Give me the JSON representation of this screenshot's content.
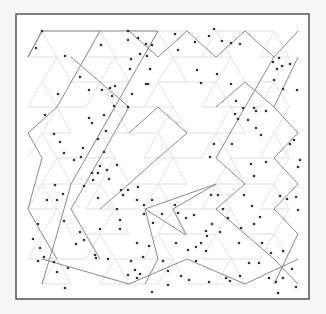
{
  "diagram": {
    "frame": {
      "x": 16,
      "y": 14,
      "w": 293,
      "h": 285,
      "stroke": "#555555",
      "fill": "#ffffff"
    },
    "lattice": {
      "rows_y": [
        31,
        57,
        82,
        107,
        133,
        158,
        184,
        209,
        234,
        259,
        284
      ],
      "even_x0": 42,
      "odd_x0": 28,
      "dx": 29,
      "faint_color": "#d8d8d8",
      "path_color": "#8a8a8a",
      "dot_color": "#333333"
    },
    "paths": [
      [
        [
          42,
          31
        ],
        [
          28,
          57
        ],
        [
          42,
          31
        ],
        [
          158,
          31
        ]
      ],
      [
        [
          158,
          31
        ],
        [
          100,
          133
        ],
        [
          71,
          184
        ],
        [
          57,
          234
        ],
        [
          42,
          284
        ]
      ],
      [
        [
          100,
          31
        ],
        [
          57,
          107
        ],
        [
          28,
          133
        ],
        [
          42,
          158
        ],
        [
          28,
          209
        ],
        [
          42,
          234
        ],
        [
          57,
          259
        ]
      ],
      [
        [
          71,
          57
        ],
        [
          100,
          82
        ],
        [
          129,
          107
        ],
        [
          100,
          158
        ],
        [
          71,
          209
        ],
        [
          100,
          259
        ]
      ],
      [
        [
          187,
          31
        ],
        [
          216,
          57
        ],
        [
          245,
          31
        ],
        [
          274,
          57
        ],
        [
          298,
          31
        ]
      ],
      [
        [
          187,
          31
        ],
        [
          158,
          57
        ],
        [
          129,
          31
        ]
      ],
      [
        [
          274,
          57
        ],
        [
          245,
          107
        ],
        [
          216,
          158
        ],
        [
          245,
          184
        ],
        [
          216,
          209
        ],
        [
          245,
          234
        ],
        [
          274,
          259
        ],
        [
          298,
          284
        ]
      ],
      [
        [
          145,
          209
        ],
        [
          216,
          184
        ],
        [
          173,
          209
        ],
        [
          186,
          235
        ],
        [
          145,
          209
        ],
        [
          158,
          259
        ],
        [
          145,
          284
        ]
      ],
      [
        [
          298,
          57
        ],
        [
          274,
          107
        ],
        [
          298,
          133
        ],
        [
          274,
          158
        ],
        [
          298,
          184
        ],
        [
          274,
          209
        ],
        [
          298,
          234
        ],
        [
          274,
          284
        ]
      ],
      [
        [
          129,
          133
        ],
        [
          158,
          107
        ],
        [
          187,
          133
        ],
        [
          158,
          158
        ],
        [
          129,
          184
        ],
        [
          100,
          209
        ]
      ],
      [
        [
          42,
          259
        ],
        [
          129,
          284
        ],
        [
          187,
          259
        ],
        [
          245,
          284
        ],
        [
          298,
          259
        ]
      ],
      [
        [
          216,
          107
        ],
        [
          245,
          82
        ],
        [
          274,
          107
        ]
      ]
    ],
    "dots": [
      [
        42,
        31
      ],
      [
        36,
        48
      ],
      [
        65,
        56
      ],
      [
        101,
        45
      ],
      [
        80,
        77
      ],
      [
        89,
        90
      ],
      [
        102,
        90
      ],
      [
        110,
        88
      ],
      [
        115,
        86
      ],
      [
        112,
        96
      ],
      [
        114,
        106
      ],
      [
        104,
        115
      ],
      [
        106,
        131
      ],
      [
        98,
        139
      ],
      [
        89,
        118
      ],
      [
        92,
        123
      ],
      [
        58,
        94
      ],
      [
        45,
        115
      ],
      [
        54,
        134
      ],
      [
        83,
        148
      ],
      [
        60,
        142
      ],
      [
        64,
        153
      ],
      [
        74,
        160
      ],
      [
        81,
        157
      ],
      [
        104,
        152
      ],
      [
        100,
        166
      ],
      [
        107,
        170
      ],
      [
        98,
        173
      ],
      [
        109,
        179
      ],
      [
        117,
        165
      ],
      [
        121,
        190
      ],
      [
        132,
        94
      ],
      [
        146,
        84
      ],
      [
        128,
        107
      ],
      [
        128,
        31
      ],
      [
        128,
        40
      ],
      [
        138,
        38
      ],
      [
        146,
        44
      ],
      [
        152,
        45
      ],
      [
        131,
        59
      ],
      [
        140,
        54
      ],
      [
        147,
        56
      ],
      [
        150,
        69
      ],
      [
        130,
        69
      ],
      [
        148,
        84
      ],
      [
        175,
        34
      ],
      [
        178,
        50
      ],
      [
        195,
        42
      ],
      [
        209,
        36
      ],
      [
        214,
        29
      ],
      [
        222,
        41
      ],
      [
        231,
        43
      ],
      [
        240,
        44
      ],
      [
        197,
        70
      ],
      [
        201,
        83
      ],
      [
        217,
        74
      ],
      [
        231,
        84
      ],
      [
        236,
        101
      ],
      [
        235,
        114
      ],
      [
        243,
        108
      ],
      [
        238,
        119
      ],
      [
        254,
        108
      ],
      [
        256,
        128
      ],
      [
        261,
        135
      ],
      [
        256,
        111
      ],
      [
        266,
        111
      ],
      [
        273,
        62
      ],
      [
        277,
        69
      ],
      [
        279,
        58
      ],
      [
        282,
        66
      ],
      [
        290,
        64
      ],
      [
        274,
        80
      ],
      [
        283,
        89
      ],
      [
        297,
        90
      ],
      [
        294,
        140
      ],
      [
        290,
        144
      ],
      [
        300,
        160
      ],
      [
        298,
        167
      ],
      [
        248,
        120
      ],
      [
        251,
        164
      ],
      [
        232,
        144
      ],
      [
        214,
        144
      ],
      [
        210,
        157
      ],
      [
        266,
        162
      ],
      [
        254,
        176
      ],
      [
        55,
        185
      ],
      [
        57,
        200
      ],
      [
        47,
        200
      ],
      [
        38,
        224
      ],
      [
        63,
        194
      ],
      [
        64,
        221
      ],
      [
        92,
        173
      ],
      [
        84,
        186
      ],
      [
        93,
        180
      ],
      [
        98,
        198
      ],
      [
        123,
        195
      ],
      [
        128,
        190
      ],
      [
        117,
        209
      ],
      [
        138,
        187
      ],
      [
        137,
        200
      ],
      [
        144,
        205
      ],
      [
        144,
        214
      ],
      [
        152,
        200
      ],
      [
        153,
        223
      ],
      [
        162,
        214
      ],
      [
        175,
        205
      ],
      [
        178,
        213
      ],
      [
        186,
        218
      ],
      [
        194,
        215
      ],
      [
        211,
        195
      ],
      [
        218,
        195
      ],
      [
        223,
        209
      ],
      [
        244,
        195
      ],
      [
        252,
        206
      ],
      [
        260,
        217
      ],
      [
        280,
        196
      ],
      [
        287,
        199
      ],
      [
        296,
        197
      ],
      [
        298,
        210
      ],
      [
        254,
        224
      ],
      [
        241,
        228
      ],
      [
        228,
        218
      ],
      [
        212,
        224
      ],
      [
        220,
        232
      ],
      [
        207,
        236
      ],
      [
        201,
        243
      ],
      [
        206,
        251
      ],
      [
        33,
        239
      ],
      [
        40,
        248
      ],
      [
        44,
        257
      ],
      [
        38,
        261
      ],
      [
        54,
        262
      ],
      [
        57,
        272
      ],
      [
        68,
        268
      ],
      [
        65,
        288
      ],
      [
        95,
        255
      ],
      [
        96,
        258
      ],
      [
        108,
        259
      ],
      [
        128,
        275
      ],
      [
        135,
        270
      ],
      [
        131,
        261
      ],
      [
        143,
        257
      ],
      [
        140,
        274
      ],
      [
        137,
        278
      ],
      [
        163,
        261
      ],
      [
        168,
        271
      ],
      [
        181,
        276
      ],
      [
        189,
        280
      ],
      [
        196,
        261
      ],
      [
        209,
        282
      ],
      [
        226,
        278
      ],
      [
        230,
        281
      ],
      [
        240,
        276
      ],
      [
        259,
        263
      ],
      [
        269,
        278
      ],
      [
        276,
        282
      ],
      [
        283,
        278
      ],
      [
        292,
        269
      ],
      [
        296,
        287
      ],
      [
        278,
        293
      ],
      [
        168,
        285
      ],
      [
        152,
        292
      ],
      [
        176,
        243
      ],
      [
        188,
        250
      ],
      [
        196,
        247
      ],
      [
        206,
        231
      ],
      [
        239,
        243
      ],
      [
        262,
        243
      ],
      [
        283,
        251
      ],
      [
        249,
        263
      ],
      [
        271,
        253
      ],
      [
        149,
        246
      ],
      [
        137,
        243
      ],
      [
        120,
        220
      ],
      [
        120,
        229
      ],
      [
        100,
        229
      ],
      [
        80,
        232
      ],
      [
        76,
        244
      ],
      [
        84,
        240
      ]
    ]
  }
}
